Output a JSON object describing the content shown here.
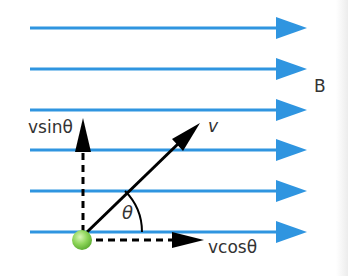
{
  "field": {
    "label": "B",
    "color": "#2f95e0",
    "lines_y": [
      28,
      69,
      110,
      150,
      191,
      232
    ]
  },
  "particle": {
    "color": "#8fd65a"
  },
  "vectors": {
    "velocity": {
      "label": "v"
    },
    "vertical_component": {
      "label": "vsinθ"
    },
    "horizontal_component": {
      "label": "vcosθ"
    }
  },
  "angle": {
    "label": "θ"
  }
}
